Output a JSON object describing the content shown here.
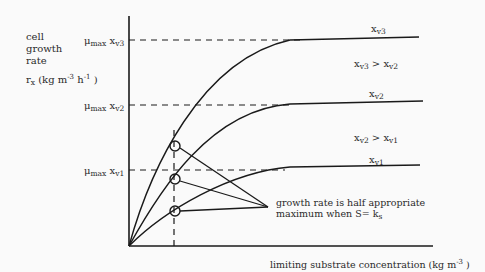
{
  "yaxis": {
    "line1": "cell",
    "line2": "growth",
    "line3": "rate",
    "rx_sym": "r",
    "rx_sub": "x",
    "units_a": " (kg  m",
    "units_exp1": "-3",
    "units_b": " h",
    "units_exp2": "-1",
    "units_c": " )"
  },
  "ticks": [
    {
      "mu": "μ",
      "mu_sub": "max",
      "x": " x",
      "x_sub": "v3"
    },
    {
      "mu": "μ",
      "mu_sub": "max",
      "x": " x",
      "x_sub": "v2"
    },
    {
      "mu": "μ",
      "mu_sub": "max",
      "x": " x",
      "x_sub": "v1"
    }
  ],
  "curves": [
    {
      "label": "x",
      "label_sub": "v3"
    },
    {
      "label": "x",
      "label_sub": "v2"
    },
    {
      "label": "x",
      "label_sub": "v1"
    }
  ],
  "comparisons": [
    {
      "a": "x",
      "a_sub": "v3",
      "op": " > ",
      "b": "x",
      "b_sub": "v2"
    },
    {
      "a": "x",
      "a_sub": "v2",
      "op": " > ",
      "b": "x",
      "b_sub": "v1"
    }
  ],
  "annotation": {
    "line1": "growth rate is half appropriate",
    "line2": "maximum when S= k",
    "line2_sub": "s"
  },
  "xaxis": {
    "label": "limiting substrate concentration (kg  m",
    "exp": "-3",
    "close": " )"
  },
  "colors": {
    "ink": "#1a1a1a",
    "background": "#fafafa"
  }
}
